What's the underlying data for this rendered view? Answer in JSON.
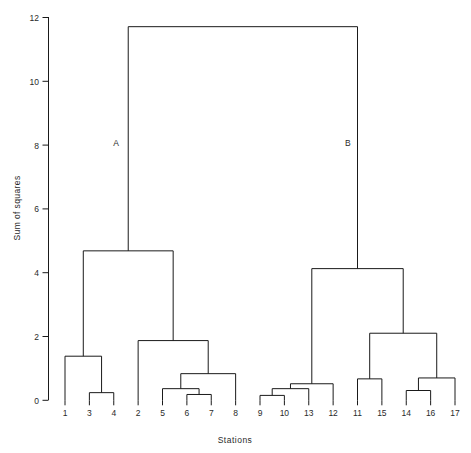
{
  "chart_data": {
    "type": "line",
    "subtype": "dendrogram",
    "title": "",
    "xlabel": "Stations",
    "ylabel": "Sum of squares",
    "ylim": [
      0,
      12.5
    ],
    "yticks": [
      0,
      2,
      4,
      6,
      8,
      10,
      12
    ],
    "ytick_labels": [
      "0",
      "2",
      "4",
      "6",
      "8",
      "10",
      "12"
    ],
    "grid": false,
    "legend": null,
    "leaf_order": [
      "1",
      "3",
      "4",
      "2",
      "5",
      "6",
      "7",
      "8",
      "9",
      "10",
      "13",
      "12",
      "11",
      "15",
      "14",
      "16",
      "17"
    ],
    "xtick_labels": [
      "1",
      "3",
      "4",
      "2",
      "5",
      "6",
      "7",
      "8",
      "9",
      "10",
      "13",
      "12",
      "11",
      "15",
      "14",
      "16",
      "17"
    ],
    "annotations": [
      {
        "text": "A",
        "x_leaf_index": 2.1,
        "y": 8.3
      },
      {
        "text": "B",
        "x_leaf_index": 11.6,
        "y": 8.3
      }
    ],
    "merges": [
      {
        "id": "m1",
        "left": "3",
        "right": "4",
        "height": 0.25
      },
      {
        "id": "m2",
        "left": "1",
        "right": "m1",
        "height": 1.44
      },
      {
        "id": "m3",
        "left": "6",
        "right": "7",
        "height": 0.19
      },
      {
        "id": "m4",
        "left": "5",
        "right": "m3",
        "height": 0.38
      },
      {
        "id": "m5",
        "left": "m4",
        "right": "8",
        "height": 0.87
      },
      {
        "id": "m6",
        "left": "2",
        "right": "m5",
        "height": 1.95
      },
      {
        "id": "A",
        "left": "m2",
        "right": "m6",
        "height": 4.88
      },
      {
        "id": "m7",
        "left": "9",
        "right": "10",
        "height": 0.16
      },
      {
        "id": "m8",
        "left": "m7",
        "right": "13",
        "height": 0.38
      },
      {
        "id": "m9",
        "left": "m8",
        "right": "12",
        "height": 0.54
      },
      {
        "id": "m10",
        "left": "11",
        "right": "15",
        "height": 0.7
      },
      {
        "id": "m11",
        "left": "14",
        "right": "16",
        "height": 0.32
      },
      {
        "id": "m12",
        "left": "m11",
        "right": "17",
        "height": 0.73
      },
      {
        "id": "m13",
        "left": "m10",
        "right": "m12",
        "height": 2.19
      },
      {
        "id": "B",
        "left": "m9",
        "right": "m13",
        "height": 4.3
      },
      {
        "id": "root",
        "left": "A",
        "right": "B",
        "height": 12.2
      }
    ],
    "line_color": "#1a1a1a"
  },
  "axes": {
    "y_title": "Sum of squares",
    "x_title": "Stations",
    "y_ticks": [
      "12",
      "10",
      "8",
      "6",
      "4",
      "2",
      "0"
    ]
  },
  "labels": {
    "cluster_a": "A",
    "cluster_b": "B"
  }
}
